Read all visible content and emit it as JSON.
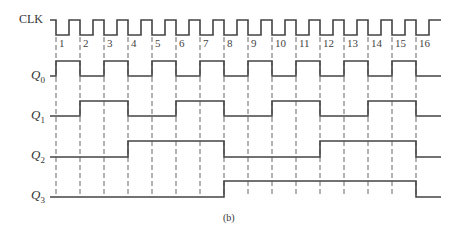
{
  "diagram": {
    "caption": "(b)",
    "signals": [
      {
        "name": "CLK",
        "label_main": "CLK",
        "label_sub": ""
      },
      {
        "name": "Q0",
        "label_main": "Q",
        "label_sub": "0"
      },
      {
        "name": "Q1",
        "label_main": "Q",
        "label_sub": "1"
      },
      {
        "name": "Q2",
        "label_main": "Q",
        "label_sub": "2"
      },
      {
        "name": "Q3",
        "label_main": "Q",
        "label_sub": "3"
      }
    ],
    "clock_pulses": [
      "1",
      "2",
      "3",
      "4",
      "5",
      "6",
      "7",
      "8",
      "9",
      "10",
      "11",
      "12",
      "13",
      "14",
      "15",
      "16"
    ],
    "waveforms": {
      "Q0": [
        0,
        1,
        0,
        1,
        0,
        1,
        0,
        1,
        0,
        1,
        0,
        1,
        0,
        1,
        0,
        1,
        0
      ],
      "Q1": [
        0,
        0,
        1,
        1,
        0,
        0,
        1,
        1,
        0,
        0,
        1,
        1,
        0,
        0,
        1,
        1,
        0
      ],
      "Q2": [
        0,
        0,
        0,
        0,
        1,
        1,
        1,
        1,
        0,
        0,
        0,
        0,
        1,
        1,
        1,
        1,
        0
      ],
      "Q3": [
        0,
        0,
        0,
        0,
        0,
        0,
        0,
        0,
        1,
        1,
        1,
        1,
        1,
        1,
        1,
        1,
        0
      ]
    },
    "colors": {
      "line": "#444444",
      "dash": "#555555"
    }
  }
}
